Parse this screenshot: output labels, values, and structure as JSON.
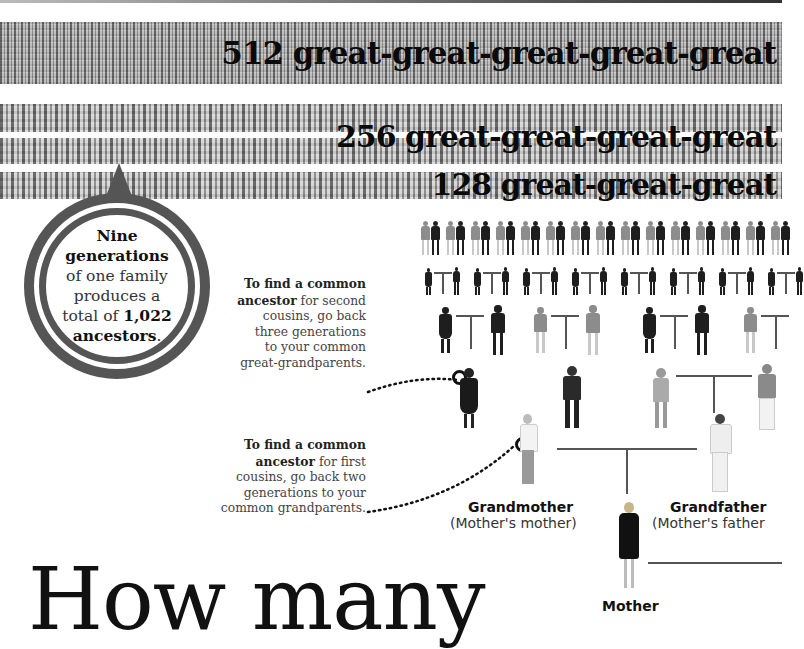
{
  "bands": [
    {
      "count": 512,
      "label": "512 great-great-great-great-great"
    },
    {
      "count": 256,
      "label": "256 great-great-great-great"
    },
    {
      "count": 128,
      "label": "128 great-great-great"
    }
  ],
  "callout": {
    "line1": "Nine",
    "line2": "generations",
    "line3": "of one family",
    "line4": "produces a",
    "line5_prefix": "total of ",
    "line5_number": "1,022",
    "line6": "ancestors",
    "line6_suffix": "."
  },
  "notes": {
    "second_cousins": {
      "bold1": "To find a common",
      "bold2": "ancestor",
      "rest2": " for second",
      "line3": "cousins, go back",
      "line4": "three generations",
      "line5": "to your common",
      "line6": "great-grandparents."
    },
    "first_cousins": {
      "bold1": "To find a common",
      "bold2": "ancestor",
      "rest2": " for first",
      "line3": "cousins, go back two",
      "line4": "generations to your",
      "line5": "common grandparents."
    }
  },
  "tree": {
    "grandmother": {
      "title": "Grandmother",
      "subtitle": "(Mother's mother)"
    },
    "grandfather": {
      "title": "Grandfather",
      "subtitle": "(Mother's father"
    },
    "mother": {
      "title": "Mother"
    }
  },
  "headline": "How many",
  "colors": {
    "ring": "#555555",
    "text": "#111111",
    "band": "#a9a9a9"
  }
}
